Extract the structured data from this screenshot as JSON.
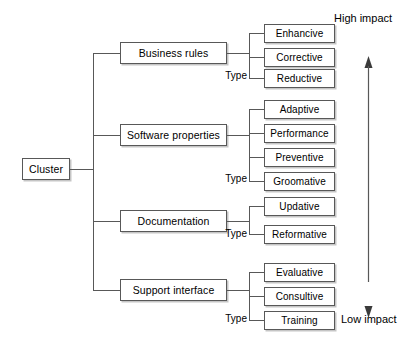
{
  "diagram": {
    "type": "hierarchy-tree",
    "root": {
      "label": "Cluster"
    },
    "branches": [
      {
        "label": "Business rules",
        "type_label": "Type",
        "leaves": [
          "Enhancive",
          "Corrective",
          "Reductive"
        ]
      },
      {
        "label": "Software properties",
        "type_label": "Type",
        "leaves": [
          "Adaptive",
          "Performance",
          "Preventive",
          "Groomative"
        ]
      },
      {
        "label": "Documentation",
        "type_label": "Type",
        "leaves": [
          "Updative",
          "Reformative"
        ]
      },
      {
        "label": "Support interface",
        "type_label": "Type",
        "leaves": [
          "Evaluative",
          "Consultive",
          "Training"
        ]
      }
    ],
    "axis": {
      "top_label": "High impact",
      "bottom_label": "Low impact",
      "up_arrow_icon": "arrow-up-icon",
      "down_arrow_icon": "arrow-down-icon"
    },
    "colors": {
      "line": "#585858",
      "box_fill": "#ffffff",
      "text": "#000000",
      "shadow": "#969696"
    }
  }
}
